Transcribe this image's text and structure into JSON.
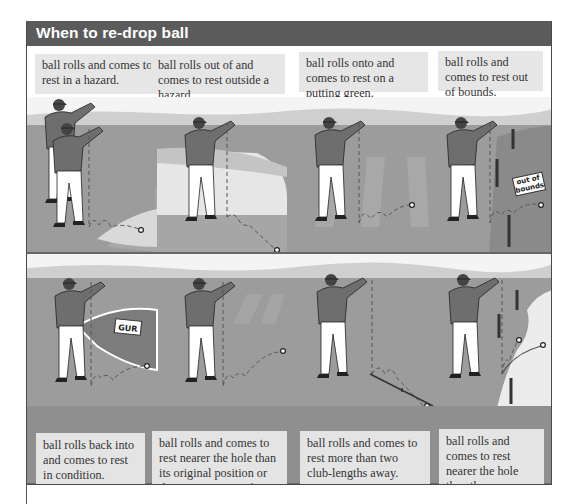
{
  "header": {
    "title": "When to re-drop ball"
  },
  "top_row": {
    "captions": [
      "ball rolls and comes to rest in a hazard.",
      "ball rolls out of and comes to rest outside a hazard.",
      "ball rolls onto and comes to rest on a putting green.",
      "ball rolls and comes to rest out of bounds."
    ],
    "signs": {
      "out_of_bounds": "out of bounds"
    }
  },
  "bottom_row": {
    "captions": [
      "ball rolls back into and comes to rest in condition.",
      "ball rolls and comes to rest nearer the hole than its original position or the nearest point of relief.",
      "ball rolls and comes to rest more than two club-lengths away.",
      "ball rolls and comes to rest nearer the hole than the appropriate reference point."
    ],
    "signs": {
      "gur": "GUR"
    }
  },
  "icons": [
    "golfer-dropping-ball-icon",
    "dashed-drop-line",
    "bounce-path-arrow",
    "ball-icon",
    "stake-icon",
    "sign-icon"
  ],
  "colors": {
    "header_bg": "#5b5b5b",
    "header_text": "#ffffff",
    "caption_bg": "#e6e6e6",
    "ground": "#9a9a9a",
    "sky": "#f2f2f2"
  }
}
